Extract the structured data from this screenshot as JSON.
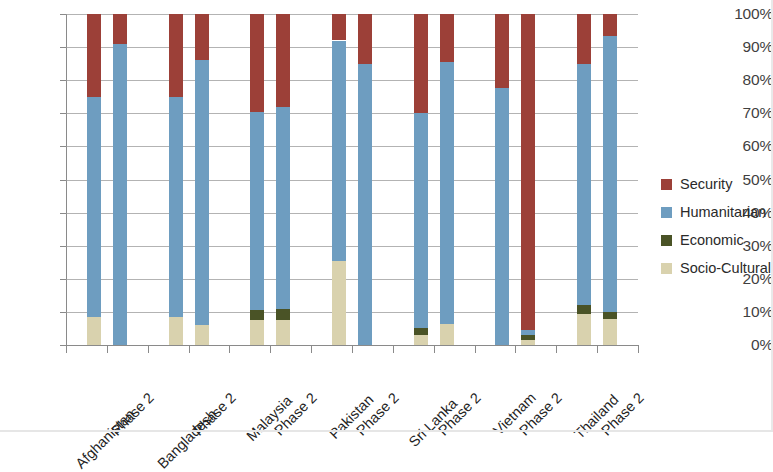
{
  "chart_data": {
    "type": "bar",
    "subtype": "stacked-percent",
    "title": "",
    "xlabel": "",
    "ylabel": "",
    "ylim": [
      0,
      100
    ],
    "y_tick_labels": [
      "0%",
      "10%",
      "20%",
      "30%",
      "40%",
      "50%",
      "60%",
      "70%",
      "80%",
      "90%",
      "100%"
    ],
    "y_tick_values": [
      0,
      10,
      20,
      30,
      40,
      50,
      60,
      70,
      80,
      90,
      100
    ],
    "grid": true,
    "legend_position": "right",
    "categories": [
      "Afghanistan",
      "Phase 2",
      "Bangladesh",
      "Phase 2",
      "Malaysia",
      "Phase 2",
      "Pakistan",
      "Phase 2",
      "Sri Lanka",
      "Phase 2",
      "Vietnam",
      "Phase 2",
      "Thailand",
      "Phase 2"
    ],
    "groups": [
      {
        "country": "Afghanistan",
        "bars": [
          "Afghanistan",
          "Phase 2"
        ]
      },
      {
        "country": "Bangladesh",
        "bars": [
          "Bangladesh",
          "Phase 2"
        ]
      },
      {
        "country": "Malaysia",
        "bars": [
          "Malaysia",
          "Phase 2"
        ]
      },
      {
        "country": "Pakistan",
        "bars": [
          "Pakistan",
          "Phase 2"
        ]
      },
      {
        "country": "Sri Lanka",
        "bars": [
          "Sri Lanka",
          "Phase 2"
        ]
      },
      {
        "country": "Vietnam",
        "bars": [
          "Vietnam",
          "Phase 2"
        ]
      },
      {
        "country": "Thailand",
        "bars": [
          "Thailand",
          "Phase 2"
        ]
      }
    ],
    "series": [
      {
        "name": "Socio-Cultural",
        "color": "#d9d2ae",
        "values": [
          8.5,
          0,
          8.5,
          6.0,
          7.5,
          7.5,
          25.5,
          0,
          3.0,
          6.5,
          0,
          1.5,
          9.5,
          8.0
        ]
      },
      {
        "name": "Economic",
        "color": "#4a5326",
        "values": [
          0,
          0,
          0,
          0,
          3.0,
          3.5,
          0,
          0,
          2.0,
          0,
          0,
          1.5,
          2.5,
          2.0
        ]
      },
      {
        "name": "Humanitarian",
        "color": "#6e9dc0",
        "values": [
          66.5,
          91.0,
          66.5,
          80.0,
          60.0,
          61.0,
          66.5,
          85.0,
          65.0,
          79.0,
          77.5,
          1.5,
          73.0,
          83.5
        ]
      },
      {
        "name": "Security",
        "color": "#9c4038",
        "values": [
          25.0,
          9.0,
          25.0,
          14.0,
          29.5,
          28.0,
          8.0,
          15.0,
          30.0,
          14.5,
          22.5,
          95.5,
          15.0,
          6.5
        ]
      }
    ],
    "stack_order": [
      "Socio-Cultural",
      "Economic",
      "Humanitarian",
      "Security"
    ]
  },
  "legend": {
    "items": [
      {
        "label": "Security",
        "color": "#9c4038",
        "swatch_name": "legend-swatch-security"
      },
      {
        "label": "Humanitarian",
        "color": "#6e9dc0",
        "swatch_name": "legend-swatch-humanitarian"
      },
      {
        "label": "Economic",
        "color": "#4a5326",
        "swatch_name": "legend-swatch-economic"
      },
      {
        "label": "Socio-Cultural",
        "color": "#d9d2ae",
        "swatch_name": "legend-swatch-socio-cultural"
      }
    ]
  },
  "colors": {
    "security": "#9c4038",
    "humanitarian": "#6e9dc0",
    "economic": "#4a5326",
    "socio_cultural": "#d9d2ae",
    "axis": "#8a8a8a",
    "grid": "#9a9a9a",
    "text": "#2a2a2a",
    "background": "#ffffff"
  }
}
